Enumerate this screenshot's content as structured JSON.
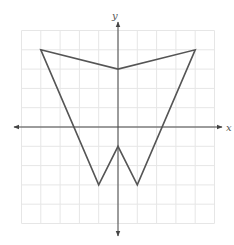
{
  "figure": {
    "axes": {
      "x_label": "x",
      "y_label": "y"
    },
    "grid": {
      "x_min": -5,
      "x_max": 5,
      "y_min": -5,
      "y_max": 5,
      "step": 1
    },
    "colors": {
      "grid": "#e6e6e6",
      "axis": "#444444",
      "shape": "#555555",
      "background": "#ffffff"
    },
    "shape": {
      "type": "polygon",
      "vertices": [
        [
          -4,
          4
        ],
        [
          0,
          3
        ],
        [
          4,
          4
        ],
        [
          1,
          -3
        ],
        [
          0,
          -1
        ],
        [
          -1,
          -3
        ]
      ]
    }
  },
  "chart_data": {
    "type": "scatter",
    "title": "",
    "xlabel": "x",
    "ylabel": "y",
    "xlim": [
      -5,
      5
    ],
    "ylim": [
      -5,
      5
    ],
    "grid": true,
    "series": [
      {
        "name": "polygon",
        "closed": true,
        "x": [
          -4,
          0,
          4,
          1,
          0,
          -1
        ],
        "y": [
          4,
          3,
          4,
          -3,
          -1,
          -3
        ]
      }
    ]
  }
}
